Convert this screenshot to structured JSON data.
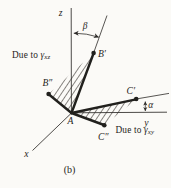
{
  "diagram": {
    "background": "#fbfaf7",
    "ink": "#2d2b28",
    "hatch_color": "#55524d",
    "axis_labels": {
      "z": "z",
      "y": "y",
      "x": "x"
    },
    "point_labels": {
      "a": "A",
      "b_prime": "B′",
      "b_double_prime": "B″",
      "c_prime": "C′",
      "c_double_prime": "C″"
    },
    "angle_labels": {
      "beta": "β",
      "alpha": "α"
    },
    "callouts": {
      "xz": {
        "prefix": "Due to ",
        "gamma": "γ",
        "subscript": "xz"
      },
      "xy": {
        "prefix": "Due to ",
        "gamma": "γ",
        "subscript": "xy"
      }
    },
    "caption": "(b)"
  }
}
